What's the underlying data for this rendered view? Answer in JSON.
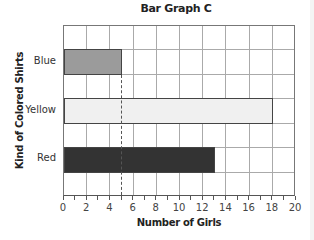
{
  "chart_data": {
    "type": "bar",
    "orientation": "horizontal",
    "title": "Bar Graph C",
    "xlabel": "Number of Girls",
    "ylabel": "Kind of Colored Shirts",
    "categories": [
      "Blue",
      "Yellow",
      "Red"
    ],
    "values": [
      5,
      18,
      13
    ],
    "bar_colors": [
      "#9b9b9b",
      "#f0f0f0",
      "#333333"
    ],
    "xlim": [
      0,
      20
    ],
    "xticks": [
      0,
      2,
      4,
      6,
      8,
      10,
      12,
      14,
      16,
      18,
      20
    ],
    "grid": true,
    "reference_line": {
      "x": 5,
      "style": "dashed"
    }
  }
}
